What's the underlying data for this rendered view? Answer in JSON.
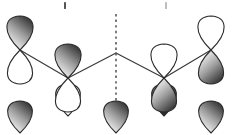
{
  "figure": {
    "width": 232,
    "height": 135,
    "background": "#ffffff"
  },
  "style": {
    "outline_color": "#2b2b2b",
    "outline_width": 1.1,
    "bond_color": "#3a3a3a",
    "bond_width": 1.2,
    "node_color": "#2b2b2b",
    "shaded_top": "#f2f2f2",
    "shaded_mid": "#9a9a9a",
    "shaded_bottom": "#2e2e2e",
    "empty_fill": "#ffffff",
    "mirror_color": "#5a5a5a"
  },
  "chart_data": {
    "type": "diagram",
    "xlabel": "",
    "ylabel": "",
    "grid": false,
    "legend": null,
    "mirror_plane": {
      "label": "mirror-plane",
      "orientation": "vertical",
      "x": 116,
      "y_top": 14,
      "y_bottom": 120,
      "dash": "2.4 3.2",
      "color": "#5a5a5a",
      "width": 1.6
    },
    "bond_vertices": [
      {
        "name": "node-1",
        "x": 20,
        "y": 50
      },
      {
        "name": "node-2",
        "x": 68,
        "y": 78
      },
      {
        "name": "apex",
        "x": 116,
        "y": 53
      },
      {
        "name": "node-3",
        "x": 164,
        "y": 78
      },
      {
        "name": "node-4",
        "x": 211,
        "y": 50
      }
    ],
    "bonds": [
      {
        "name": "bond-1-2",
        "from": "node-1",
        "to": "node-2"
      },
      {
        "name": "bond-2-apex",
        "from": "node-2",
        "to": "apex"
      },
      {
        "name": "bond-apex-3",
        "from": "apex",
        "to": "node-3"
      },
      {
        "name": "bond-3-4",
        "from": "node-3",
        "to": "node-4"
      }
    ],
    "orbitals": [
      {
        "name": "orbital-1",
        "index": 1,
        "cx": 20,
        "cy": 50,
        "phase_top": "shaded",
        "phase_bottom": "empty",
        "lobe_rx": 18,
        "lobe_ry": 34,
        "row": "top"
      },
      {
        "name": "orbital-2",
        "index": 2,
        "cx": 68,
        "cy": 78,
        "phase_top": "shaded",
        "phase_bottom": "empty",
        "lobe_rx": 18,
        "lobe_ry": 34,
        "row": "top"
      },
      {
        "name": "orbital-3",
        "index": 3,
        "cx": 164,
        "cy": 78,
        "phase_top": "empty",
        "phase_bottom": "shaded",
        "lobe_rx": 18,
        "lobe_ry": 34,
        "row": "top"
      },
      {
        "name": "orbital-4",
        "index": 4,
        "cx": 211,
        "cy": 50,
        "phase_top": "empty",
        "phase_bottom": "shaded",
        "lobe_rx": 18,
        "lobe_ry": 34,
        "row": "top"
      }
    ],
    "tick_marks": [
      {
        "name": "tick-mark-left",
        "x": 64,
        "y": 2,
        "w": 2,
        "h": 7,
        "color": "#555555"
      },
      {
        "name": "tick-mark-right",
        "x": 165,
        "y": 2,
        "w": 2,
        "h": 7,
        "color": "#bdbdbd"
      }
    ],
    "second_row_partials": [
      {
        "name": "partial-orbital-1",
        "cx": 20,
        "cy": 133,
        "phase": "shaded"
      },
      {
        "name": "partial-orbital-2",
        "cx": 68,
        "cy": 116,
        "phase": "empty"
      },
      {
        "name": "partial-orbital-3",
        "cx": 116,
        "cy": 133,
        "phase": "shaded"
      },
      {
        "name": "partial-orbital-4",
        "cx": 164,
        "cy": 116,
        "phase": "shaded-dark"
      },
      {
        "name": "partial-orbital-5",
        "cx": 211,
        "cy": 133,
        "phase": "shaded"
      }
    ]
  }
}
